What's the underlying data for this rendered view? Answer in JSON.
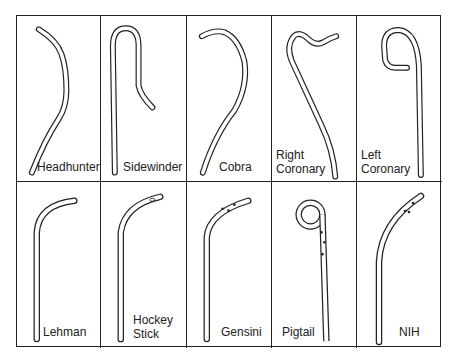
{
  "figure": {
    "rows": [
      [
        {
          "id": "headhunter",
          "label": "Headhunter"
        },
        {
          "id": "sidewinder",
          "label": "Sidewinder"
        },
        {
          "id": "cobra",
          "label": "Cobra"
        },
        {
          "id": "right-coronary",
          "label": "Right\nCoronary"
        },
        {
          "id": "left-coronary",
          "label": "Left\nCoronary"
        }
      ],
      [
        {
          "id": "lehman",
          "label": "Lehman"
        },
        {
          "id": "hockey-stick",
          "label": "Hockey\nStick"
        },
        {
          "id": "gensini",
          "label": "Gensini"
        },
        {
          "id": "pigtail",
          "label": "Pigtail"
        },
        {
          "id": "nih",
          "label": "NIH"
        }
      ]
    ],
    "colors": {
      "stroke": "#222222",
      "background": "#ffffff"
    }
  }
}
